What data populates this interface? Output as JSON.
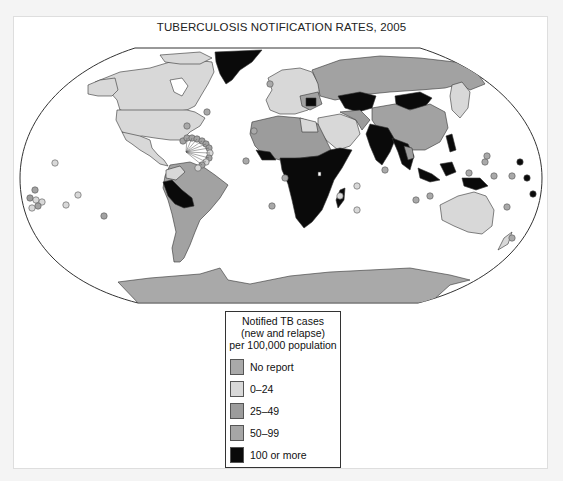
{
  "title": "TUBERCULOSIS NOTIFICATION RATES, 2005",
  "legend": {
    "heading_line1": "Notified TB cases",
    "heading_line2": "(new and relapse)",
    "heading_line3": "per 100,000 population",
    "items": [
      {
        "label": "No report",
        "color": "#a9a9a9"
      },
      {
        "label": "0–24",
        "color": "#d8d8d8"
      },
      {
        "label": "25–49",
        "color": "#9c9c9c"
      },
      {
        "label": "50–99",
        "color": "#a6a6a6"
      },
      {
        "label": "100 or more",
        "color": "#0a0a0a"
      }
    ]
  },
  "colors": {
    "no_report": "#a9a9a9",
    "low": "#d8d8d8",
    "mid": "#9c9c9c",
    "high": "#a2a2a2",
    "very_high": "#0a0a0a",
    "ocean": "#ffffff",
    "outline": "#333333"
  },
  "regions": [
    {
      "name": "North America (Canada, USA)",
      "class": "0–24"
    },
    {
      "name": "Greenland",
      "class": "100 or more"
    },
    {
      "name": "Mexico",
      "class": "0–24"
    },
    {
      "name": "Peru / Bolivia",
      "class": "100 or more"
    },
    {
      "name": "Brazil / South America",
      "class": "50–99"
    },
    {
      "name": "Western Europe",
      "class": "0–24"
    },
    {
      "name": "Russia",
      "class": "50–99"
    },
    {
      "name": "Kazakhstan / Mongolia",
      "class": "100 or more"
    },
    {
      "name": "China",
      "class": "50–99"
    },
    {
      "name": "India / SE Asia",
      "class": "100 or more"
    },
    {
      "name": "North Africa",
      "class": "25–49"
    },
    {
      "name": "Sub-Saharan Africa",
      "class": "100 or more"
    },
    {
      "name": "Middle East",
      "class": "0–24"
    },
    {
      "name": "Indonesia / Papua New Guinea",
      "class": "100 or more"
    },
    {
      "name": "Australia",
      "class": "0–24"
    },
    {
      "name": "Japan",
      "class": "0–24"
    },
    {
      "name": "Antarctica",
      "class": "No report"
    }
  ]
}
